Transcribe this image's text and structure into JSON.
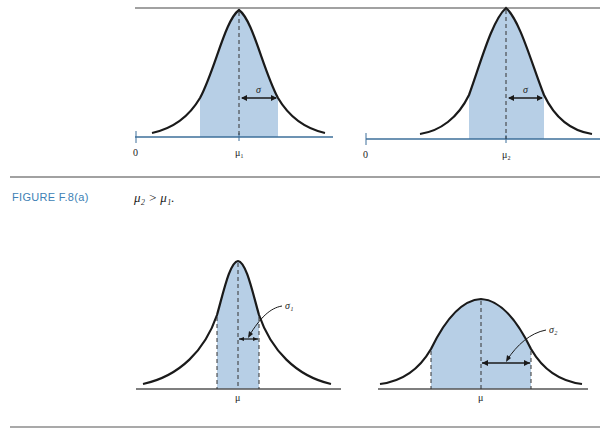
{
  "figure": {
    "label": "FIGURE F.8(a)",
    "caption": "μ₂ > μ₁."
  },
  "colors": {
    "fill": "#b7cfe6",
    "curve": "#1a1a1a",
    "axis_top": "#3d6f9a",
    "rule": "#444444",
    "label_blue": "#3d7fb5"
  },
  "top_panels": [
    {
      "origin_label": "0",
      "mean_label": "μ₁",
      "sigma_label": "σ"
    },
    {
      "origin_label": "0",
      "mean_label": "μ₂",
      "sigma_label": "σ"
    }
  ],
  "bottom_panels": [
    {
      "mean_label": "μ",
      "sigma_label": "σ₁"
    },
    {
      "mean_label": "μ",
      "sigma_label": "σ₂"
    }
  ]
}
